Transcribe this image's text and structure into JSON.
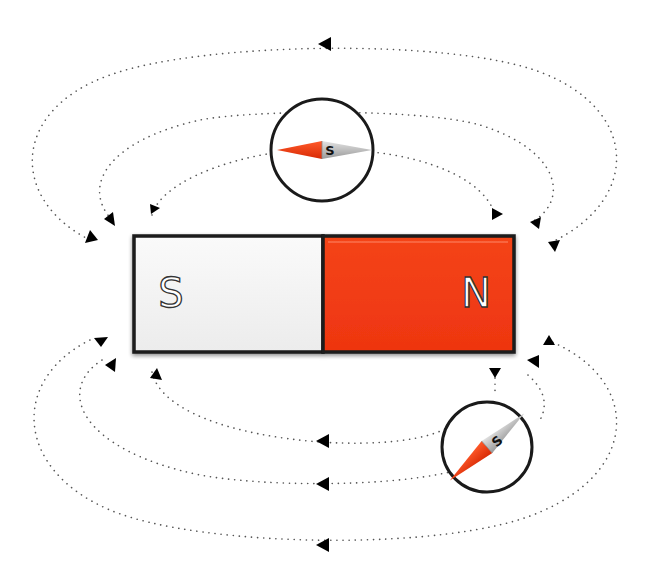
{
  "diagram": {
    "colors": {
      "background": "#ffffff",
      "north_pole": "#f23a12",
      "south_pole": "#f3f3f3",
      "outline": "#1a1a1a",
      "field_line": "#555555",
      "arrow": "#000000",
      "needle_red": "#f03a10",
      "needle_grey": "#bdbdbd"
    },
    "magnet": {
      "south_label": "S",
      "north_label": "N"
    },
    "compasses": [
      {
        "id": "top",
        "needle_label": "S",
        "position": "above magnet",
        "angle_deg": 0
      },
      {
        "id": "bottom-right",
        "needle_label": "S",
        "position": "below right of magnet",
        "angle_deg": -42
      }
    ],
    "field_lines": {
      "top": 3,
      "bottom": 3,
      "direction": "from N pole around to S pole"
    }
  }
}
